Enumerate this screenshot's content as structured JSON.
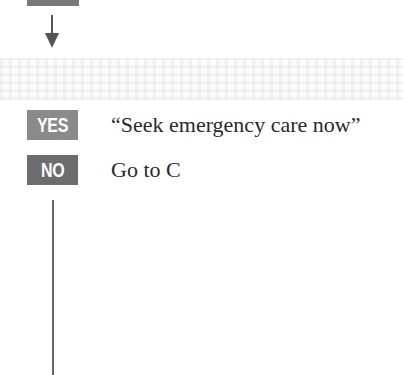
{
  "colors": {
    "yes_badge": "#8a8a8a",
    "no_badge": "#6c6c6c",
    "top_badge": "#7a7a7a",
    "line": "#555555"
  },
  "top_row": {
    "badge": "",
    "text": "Go to B"
  },
  "rows": [
    {
      "badge": "YES",
      "text": "“Seek emergency care now”"
    },
    {
      "badge": "NO",
      "text": "Go to C"
    }
  ],
  "icons": {
    "arrow": "down-arrow-icon",
    "connector": "vertical-connector-line"
  }
}
